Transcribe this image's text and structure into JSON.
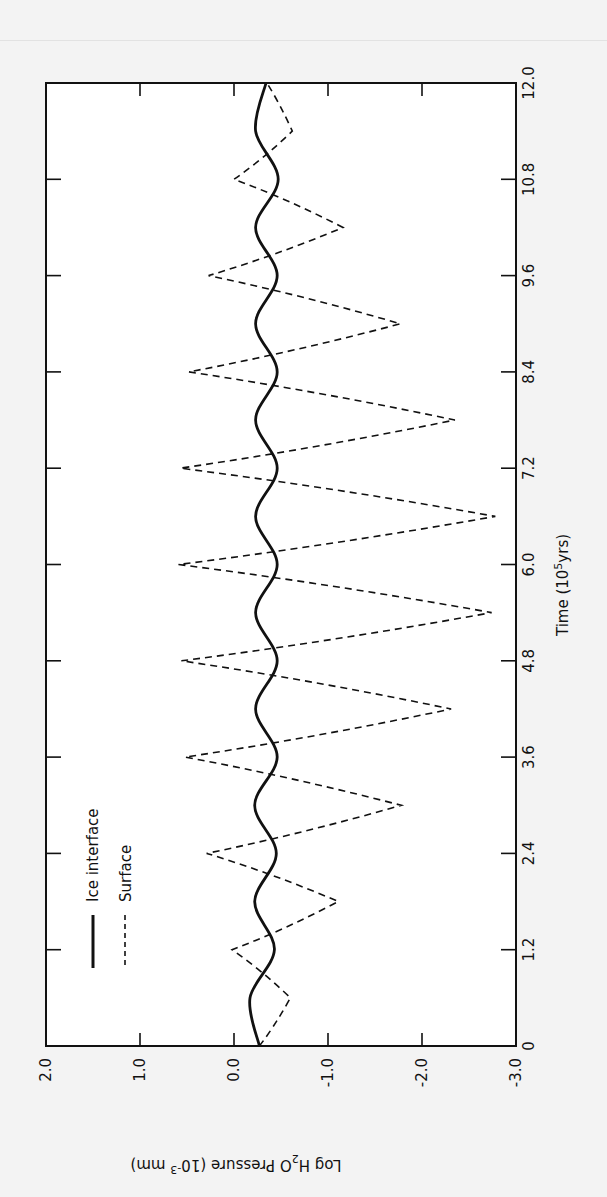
{
  "chart_data": {
    "type": "line",
    "orientation_note": "figure printed rotated 90 degrees clockwise",
    "xlabel": "Time (10^5 yrs)",
    "xlabel_parts": {
      "base": "Time (10",
      "sup": "5",
      "tail": "yrs)"
    },
    "ylabel": "Log H2O Pressure (10^-3 mm)",
    "ylabel_parts": {
      "pre": "Log H",
      "sub": "2",
      "mid": "O  Pressure  (10",
      "sup": "-3",
      "tail": " mm)"
    },
    "xlim": [
      0,
      12.0
    ],
    "ylim": [
      -3.0,
      2.0
    ],
    "x_ticks": [
      "0",
      "1.2",
      "2.4",
      "3.6",
      "4.8",
      "6.0",
      "7.2",
      "8.4",
      "9.6",
      "10.8",
      "12.0"
    ],
    "x_tick_values": [
      0,
      1.2,
      2.4,
      3.6,
      4.8,
      6.0,
      7.2,
      8.4,
      9.6,
      10.8,
      12.0
    ],
    "y_ticks": [
      "2.0",
      "1.0",
      "0.0",
      "-1.0",
      "-2.0",
      "-3.0"
    ],
    "y_tick_values": [
      2.0,
      1.0,
      0.0,
      -1.0,
      -2.0,
      -3.0
    ],
    "grid": false,
    "legend_position": "lower left (upper left in unrotated frame)",
    "series": [
      {
        "name": "Ice interface",
        "style": "solid",
        "x": [
          0,
          0.6,
          1.2,
          1.8,
          2.4,
          3.0,
          3.6,
          4.2,
          4.8,
          5.4,
          6.0,
          6.6,
          7.2,
          7.8,
          8.4,
          9.0,
          9.6,
          10.2,
          10.8,
          11.4,
          12.0
        ],
        "values": [
          -0.27,
          -0.17,
          -0.43,
          -0.22,
          -0.45,
          -0.22,
          -0.46,
          -0.23,
          -0.46,
          -0.23,
          -0.46,
          -0.23,
          -0.46,
          -0.23,
          -0.46,
          -0.23,
          -0.46,
          -0.23,
          -0.47,
          -0.23,
          -0.34
        ]
      },
      {
        "name": "Surface",
        "style": "dashed",
        "x": [
          0,
          0.6,
          1.2,
          1.8,
          2.4,
          3.0,
          3.6,
          4.2,
          4.8,
          5.4,
          6.0,
          6.6,
          7.2,
          7.8,
          8.4,
          9.0,
          9.6,
          10.2,
          10.8,
          11.4,
          12.0
        ],
        "values": [
          -0.27,
          -0.6,
          0.02,
          -1.11,
          0.29,
          -1.78,
          0.52,
          -2.31,
          0.56,
          -2.74,
          0.59,
          -2.78,
          0.57,
          -2.35,
          0.48,
          -1.77,
          0.27,
          -1.16,
          0.0,
          -0.62,
          -0.35
        ]
      }
    ]
  },
  "legend": {
    "items": [
      {
        "label": "Ice interface",
        "style": "solid"
      },
      {
        "label": "Surface",
        "style": "dashed"
      }
    ]
  },
  "colors": {
    "ink": "#111111",
    "background": "#f3f3f3",
    "plot_background": "#ffffff"
  }
}
